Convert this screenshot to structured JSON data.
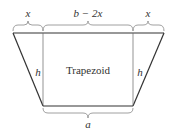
{
  "diagram": {
    "title": "Trapezoid",
    "labels": {
      "top_left": "x",
      "top_middle": "b − 2x",
      "top_right": "x",
      "left_height": "h",
      "right_height": "h",
      "bottom": "a"
    },
    "colors": {
      "stroke": "#333333",
      "brace": "#777777"
    }
  }
}
